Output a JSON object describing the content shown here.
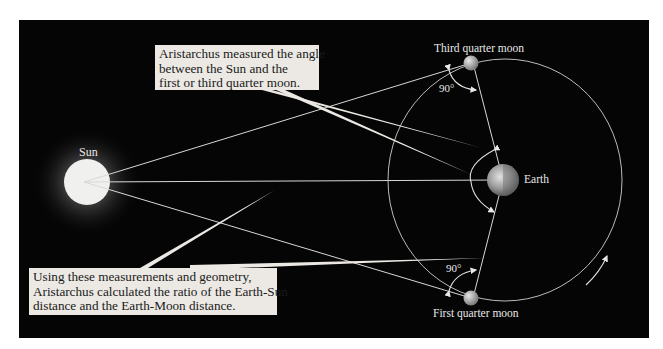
{
  "diagram": {
    "background_color": "#050505",
    "callouts": {
      "top": {
        "lines": [
          "Aristarchus measured the angle",
          "between the Sun and the",
          "first or third quarter moon."
        ]
      },
      "bottom": {
        "lines": [
          "Using these measurements and geometry,",
          "Aristarchus calculated the ratio of the Earth-Sun",
          "distance and the Earth-Moon distance."
        ]
      }
    },
    "labels": {
      "sun": "Sun",
      "earth": "Earth",
      "third_quarter_moon": "Third quarter moon",
      "first_quarter_moon": "First quarter moon",
      "angle_top": "90°",
      "angle_bottom": "90°"
    }
  }
}
